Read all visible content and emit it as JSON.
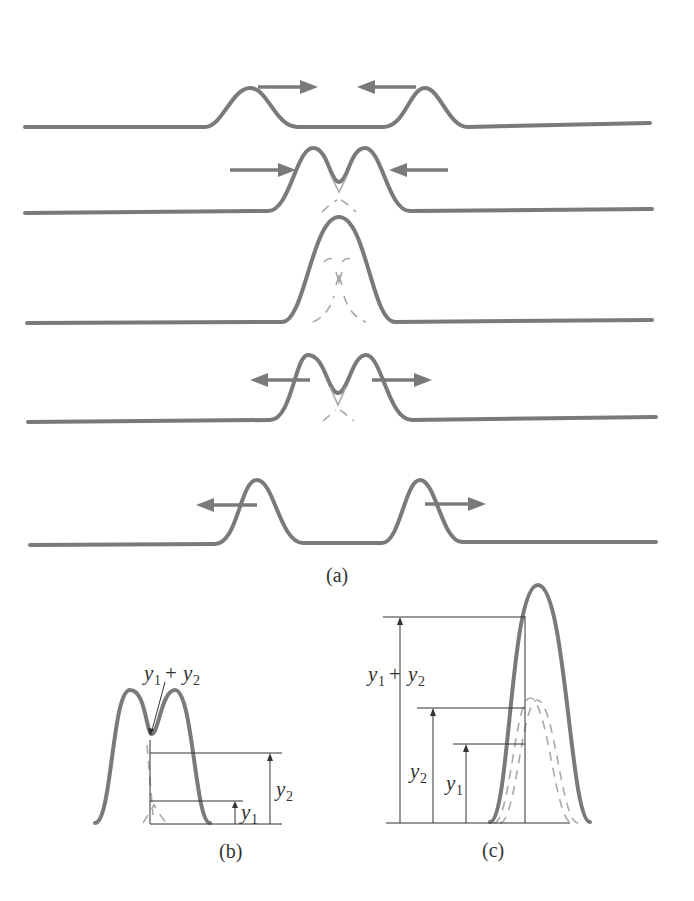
{
  "figure": {
    "panels": {
      "a": {
        "label": "(a)",
        "rows": [
          {
            "description": "two separated pulses moving toward each other",
            "arrows": [
              "right",
              "left"
            ]
          },
          {
            "description": "pulses begin to overlap",
            "arrows": [
              "right",
              "left"
            ]
          },
          {
            "description": "pulses fully overlap forming a single larger pulse",
            "arrows": []
          },
          {
            "description": "pulses begin to separate",
            "arrows": [
              "left",
              "right"
            ]
          },
          {
            "description": "pulses separated moving apart",
            "arrows": [
              "left",
              "right"
            ]
          }
        ]
      },
      "b": {
        "label": "(b)",
        "annotations": {
          "sum": {
            "var1": "y",
            "sub1": "1",
            "op": "+",
            "var2": "y",
            "sub2": "2"
          },
          "y1": {
            "var": "y",
            "sub": "1"
          },
          "y2": {
            "var": "y",
            "sub": "2"
          }
        }
      },
      "c": {
        "label": "(c)",
        "annotations": {
          "sum": {
            "var1": "y",
            "sub1": "1",
            "op": "+",
            "var2": "y",
            "sub2": "2"
          },
          "y1": {
            "var": "y",
            "sub": "1"
          },
          "y2": {
            "var": "y",
            "sub": "2"
          }
        }
      }
    },
    "colors": {
      "wave": "#7a7a7a",
      "ghost": "#a9a9a9",
      "line": "#333333"
    }
  }
}
